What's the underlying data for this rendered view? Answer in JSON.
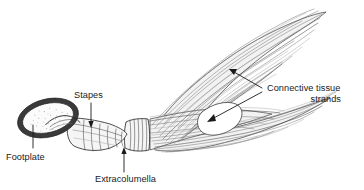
{
  "figure": {
    "kind": "anatomical-line-drawing",
    "background_color": "#ffffff",
    "ink_color": "#1a1a1a",
    "hatch_color": "#6d6d6d",
    "width": 364,
    "height": 190
  },
  "labels": {
    "footplate": {
      "text": "Footplate",
      "x": 6,
      "y": 160,
      "anchor": "start"
    },
    "stapes": {
      "text": "Stapes",
      "x": 74,
      "y": 98,
      "anchor": "start"
    },
    "extracolumella": {
      "text": "Extracolumella",
      "x": 95,
      "y": 182,
      "anchor": "start"
    },
    "connective_tissue": {
      "line1": "Connective tissue",
      "line2": "strands",
      "x1": 267,
      "y1": 91,
      "x2": 341,
      "y2": 102,
      "anchor1": "start",
      "anchor2": "end"
    }
  },
  "leaders": {
    "footplate": {
      "name": "footplate-leader",
      "path": "M 33 148 L 33 124",
      "arrow": "none"
    },
    "stapes": {
      "name": "stapes-leader",
      "path": "M 91 103 L 91 124",
      "arrow": "down",
      "arrow_x": 91,
      "arrow_y": 127
    },
    "extracolumella": {
      "name": "extracolumella-leader",
      "path": "M 124 172 L 124 152",
      "arrow": "up",
      "arrow_x": 124,
      "arrow_y": 148
    },
    "connective_upper": {
      "name": "connective-tissue-upper-leader",
      "path": "M 262 88 L 234 72",
      "arrow": "up-left",
      "arrow_x": 230,
      "arrow_y": 70
    },
    "connective_lower": {
      "name": "connective-tissue-lower-leader",
      "path": "M 262 92 L 212 119",
      "arrow": "down-left",
      "arrow_x": 208,
      "arrow_y": 121
    }
  },
  "parts": {
    "footplate": {
      "name": "footplate-shape",
      "description": "tilted oval plate with dark rim and stippled interior",
      "cx": 48,
      "cy": 118,
      "rx": 31,
      "ry": 19,
      "rotation": -14
    },
    "stapes_shaft": {
      "name": "stapes-shaft-shape",
      "description": "narrow ribbed columellar shaft sloping down to the right"
    },
    "extracolumella": {
      "name": "extracolumella-shape",
      "description": "wider ribbed collar segment joining shaft to tissue fan"
    },
    "connective_fan": {
      "name": "connective-tissue-fan-shape",
      "description": "large hatched plume splitting into an upper sweeping lobe and a lower lobe with pointed tips"
    },
    "tissue_gap": {
      "name": "tissue-gap-shape",
      "description": "white wedge-shaped gap separating the upper and lower tissue lobes"
    }
  }
}
